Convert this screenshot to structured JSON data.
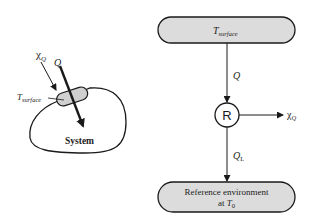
{
  "left_figure": {
    "system_label": "System",
    "surface_label_main": "T",
    "surface_label_sub": "surface",
    "exergy_label_main": "χ",
    "exergy_label_sub": "Q",
    "heat_label": "Q"
  },
  "right_figure": {
    "top_box": {
      "main": "T",
      "sub": "surface"
    },
    "heat_in_label": "Q",
    "device_label": "R",
    "exergy_out_main": "χ",
    "exergy_out_sub": "Q",
    "heat_out_main": "Q",
    "heat_out_sub": "L",
    "bottom_box": {
      "line1": "Reference environment",
      "line2_prefix": "at ",
      "line2_main": "T",
      "line2_sub": "0"
    }
  },
  "colors": {
    "box_fill": "#dcdcdc",
    "stroke": "#1a1a1a",
    "text": "#222222"
  }
}
